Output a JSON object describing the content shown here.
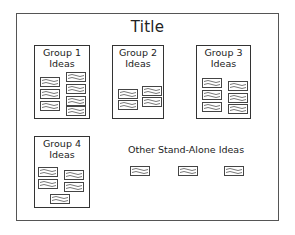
{
  "diagram": {
    "title": "Title",
    "groups": [
      {
        "label": "Group 1\nIdeas",
        "idea_count": 7
      },
      {
        "label": "Group 2\nIdeas",
        "idea_count": 4
      },
      {
        "label": "Group 3\nIdeas",
        "idea_count": 6
      },
      {
        "label": "Group 4\nIdeas",
        "idea_count": 5
      }
    ],
    "stand_alone": {
      "label": "Other Stand-Alone Ideas",
      "idea_count": 3
    },
    "idea_icon": "wavy-note-card-icon",
    "colors": {
      "border": "#333333",
      "frame": "#555555",
      "background": "#ffffff",
      "text": "#222222"
    }
  }
}
